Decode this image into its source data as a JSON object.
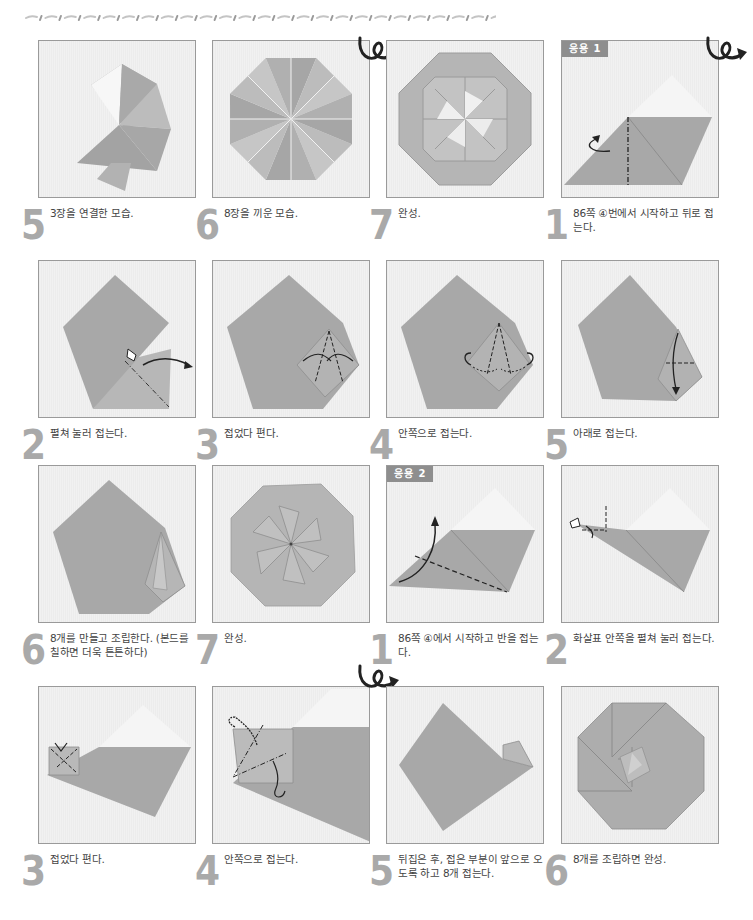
{
  "page": {
    "decorative_border": "dashed-wave-line"
  },
  "colors": {
    "paper_fill": "#a8a8a8",
    "paper_light": "#bdbdbd",
    "paper_white": "#f5f5f5",
    "panel_bg": "#eeeeee",
    "badge_bg": "#8e8e8e",
    "step_number": "#a9a9a9",
    "caption_text": "#444444"
  },
  "rows": [
    {
      "cells": [
        {
          "step": "5",
          "caption": "3장을 연결한 모습.",
          "image": "three-units-joined"
        },
        {
          "step": "6",
          "caption": "8장을 끼운 모습.",
          "image": "eight-units-octagon"
        },
        {
          "step": "7",
          "caption": "완성.",
          "image": "finished-octagon-pinwheel",
          "flip_icon": true
        },
        {
          "step": "1",
          "caption": "86쪽 ④번에서 시작하고 뒤로 접는다.",
          "image": "variation1-step1",
          "badge": "응용 1",
          "flip_icon": true
        }
      ]
    },
    {
      "cells": [
        {
          "step": "2",
          "caption": "펼쳐 눌러 접는다.",
          "image": "squash-fold-pentagon"
        },
        {
          "step": "3",
          "caption": "접었다 편다.",
          "image": "fold-and-unfold-pentagon"
        },
        {
          "step": "4",
          "caption": "안쪽으로 접는다.",
          "image": "inside-fold-pentagon"
        },
        {
          "step": "5",
          "caption": "아래로 접는다.",
          "image": "fold-down-pentagon"
        }
      ]
    },
    {
      "cells": [
        {
          "step": "6",
          "caption": "8개를 만들고 조립한다. (본드를 칠하면 더욱 튼튼하다)",
          "image": "pentagon-unit-finished"
        },
        {
          "step": "7",
          "caption": "완성.",
          "image": "finished-star-octagon"
        },
        {
          "step": "1",
          "caption": "86쪽 ④에서 시작하고 반을 접는다.",
          "image": "variation2-step1",
          "badge": "응용 2"
        },
        {
          "step": "2",
          "caption": "화살표 안쪽을 펼쳐 눌러 접는다.",
          "image": "variation2-step2"
        }
      ]
    },
    {
      "cells": [
        {
          "step": "3",
          "caption": "접었다 편다.",
          "image": "variation2-step3"
        },
        {
          "step": "4",
          "caption": "안쪽으로 접는다.",
          "image": "variation2-step4",
          "flip_icon": true
        },
        {
          "step": "5",
          "caption": "뒤집은 후, 접은 부분이 앞으로 오도록 하고 8개 접는다.",
          "image": "variation2-step5"
        },
        {
          "step": "6",
          "caption": "8개를 조립하면 완성.",
          "image": "finished-spiral-octagon"
        }
      ]
    }
  ]
}
